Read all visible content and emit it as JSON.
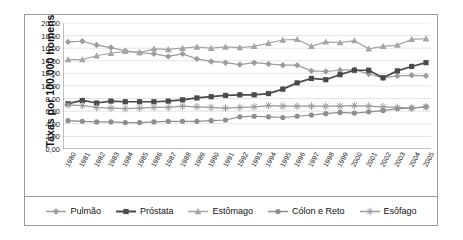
{
  "chart_data": {
    "type": "line",
    "title": "",
    "subtitle": "",
    "xlabel": "",
    "ylabel": "Taxas por 100.000 homens",
    "ylim": [
      0,
      20
    ],
    "ytick_step": 2,
    "ytick_labels": [
      "0,00",
      "2,00",
      "4,00",
      "6,00",
      "8,00",
      "10,00",
      "12,00",
      "14,00",
      "16,00",
      "18,00",
      "20,00"
    ],
    "ytick_values": [
      0,
      2,
      4,
      6,
      8,
      10,
      12,
      14,
      16,
      18,
      20
    ],
    "grid": "horizontal",
    "legend_position": "bottom",
    "categories": [
      "1980",
      "1981",
      "1982",
      "1983",
      "1984",
      "1985",
      "1986",
      "1987",
      "1988",
      "1989",
      "1990",
      "1991",
      "1992",
      "1993",
      "1994",
      "1995",
      "1996",
      "1997",
      "1998",
      "1999",
      "2000",
      "2001",
      "2002",
      "2003",
      "2004",
      "2005"
    ],
    "x": [
      1980,
      1981,
      1982,
      1983,
      1984,
      1985,
      1986,
      1987,
      1988,
      1989,
      1990,
      1991,
      1992,
      1993,
      1994,
      1995,
      1996,
      1997,
      1998,
      1999,
      2000,
      2001,
      2002,
      2003,
      2004,
      2005
    ],
    "series": [
      {
        "name": "Pulmão",
        "color": "#9c9c9c",
        "marker": "diamond",
        "values": [
          17.0,
          17.1,
          16.5,
          16.1,
          15.6,
          15.3,
          15.1,
          14.7,
          15.1,
          14.3,
          13.9,
          13.7,
          13.4,
          13.7,
          13.5,
          13.3,
          13.3,
          12.4,
          12.3,
          12.5,
          12.6,
          11.9,
          11.3,
          11.6,
          11.7,
          11.6
        ]
      },
      {
        "name": "Próstata",
        "color": "#4a4a4a",
        "marker": "square",
        "values": [
          7.2,
          7.7,
          7.3,
          7.6,
          7.5,
          7.5,
          7.5,
          7.6,
          7.8,
          8.1,
          8.3,
          8.5,
          8.6,
          8.6,
          8.8,
          9.5,
          10.5,
          11.2,
          11.0,
          11.8,
          12.5,
          12.5,
          11.3,
          12.4,
          13.1,
          13.7
        ]
      },
      {
        "name": "Estômago",
        "color": "#a5a5a5",
        "marker": "triangle",
        "values": [
          14.2,
          14.2,
          14.8,
          15.2,
          15.5,
          15.3,
          15.9,
          15.8,
          16.0,
          16.2,
          16.0,
          16.2,
          16.1,
          16.3,
          16.8,
          17.3,
          17.4,
          16.3,
          17.0,
          16.9,
          17.2,
          15.9,
          16.3,
          16.5,
          17.4,
          17.5
        ]
      },
      {
        "name": "Cólon e Reto",
        "color": "#8e8e8e",
        "marker": "circle",
        "values": [
          4.5,
          4.4,
          4.3,
          4.3,
          4.2,
          4.2,
          4.3,
          4.4,
          4.4,
          4.4,
          4.5,
          4.6,
          5.1,
          5.2,
          5.1,
          5.0,
          5.2,
          5.4,
          5.6,
          5.8,
          5.7,
          5.9,
          6.1,
          6.4,
          6.5,
          6.7
        ]
      },
      {
        "name": "Esôfago",
        "color": "#9a9a9a",
        "marker": "star",
        "values": [
          7.0,
          6.9,
          6.6,
          6.5,
          6.4,
          6.5,
          6.6,
          6.6,
          6.8,
          6.7,
          6.6,
          6.5,
          6.6,
          6.7,
          6.9,
          6.8,
          6.8,
          6.8,
          6.8,
          6.8,
          6.9,
          6.8,
          6.7,
          6.6,
          6.5,
          6.7
        ]
      }
    ]
  }
}
